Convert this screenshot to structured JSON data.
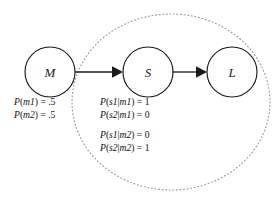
{
  "diagram": {
    "type": "causal-bayesian-network",
    "nodes": [
      {
        "id": "M",
        "label": "M",
        "cx": 50,
        "cy": 72,
        "r": 25
      },
      {
        "id": "S",
        "label": "S",
        "cx": 148,
        "cy": 72,
        "r": 25
      },
      {
        "id": "L",
        "label": "L",
        "cx": 232,
        "cy": 72,
        "r": 25
      }
    ],
    "edges": [
      {
        "from": "M",
        "to": "S",
        "label": ""
      },
      {
        "from": "S",
        "to": "L",
        "label": ""
      }
    ],
    "scope": {
      "name": "dotted-boundary",
      "shape": "ellipse",
      "cx": 171,
      "cy": 102,
      "rx": 99,
      "ry": 88,
      "style": "dotted",
      "color": "#9a9a9a",
      "encloses": [
        "S",
        "L"
      ]
    },
    "colors": {
      "background": "#ffffff",
      "stroke": "#1a1a1a",
      "text": "#111111",
      "dotted": "#9a9a9a"
    }
  },
  "prior_probabilities": {
    "name": "marginal-priors-for-M",
    "lines": [
      "P(m1) = .5",
      "P(m2) = .5"
    ]
  },
  "conditional_probabilities": {
    "name": "conditional-probabilities-for-S-given-M",
    "group_one": [
      "P(s1|m1) = 1",
      "P(s2|m1) = 0"
    ],
    "group_two": [
      "P(s1|m2) = 0",
      "P(s2|m2) = 1"
    ]
  }
}
